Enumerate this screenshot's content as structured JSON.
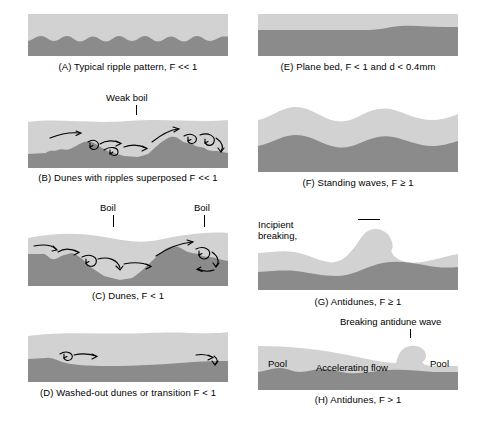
{
  "figure": {
    "colors": {
      "water": "#d2d2d2",
      "sediment": "#8b8b8b",
      "arrow": "#000000",
      "background": "#ffffff",
      "text": "#000000"
    }
  },
  "panels": [
    {
      "id": "A",
      "caption": "(A) Typical ripple pattern, F << 1",
      "annotations": []
    },
    {
      "id": "B",
      "caption": "(B) Dunes with ripples superposed F << 1",
      "annotations": [
        {
          "name": "weak-boil",
          "text": "Weak boil"
        }
      ]
    },
    {
      "id": "C",
      "caption": "(C) Dunes, F < 1",
      "annotations": [
        {
          "name": "boil-left",
          "text": "Boil"
        },
        {
          "name": "boil-right",
          "text": "Boil"
        }
      ]
    },
    {
      "id": "D",
      "caption": "(D) Washed-out dunes or transition F < 1",
      "annotations": []
    },
    {
      "id": "E",
      "caption": "(E) Plane bed, F < 1 and d < 0.4mm",
      "annotations": []
    },
    {
      "id": "F",
      "caption": "(F) Standing waves, F ≥ 1",
      "annotations": []
    },
    {
      "id": "G",
      "caption": "(G) Antidunes, F ≥ 1",
      "annotations": [
        {
          "name": "incipient-breaking",
          "line1": "Incipient breaking,",
          "line2": "and moving upstream"
        }
      ]
    },
    {
      "id": "H",
      "caption": "(H) Antidunes, F > 1",
      "annotations": [
        {
          "name": "breaking-antidune-wave",
          "text": "Breaking antidune wave"
        },
        {
          "name": "pool-left",
          "text": "Pool"
        },
        {
          "name": "accelerating-flow",
          "text": "Accelerating flow"
        },
        {
          "name": "pool-right",
          "text": "Pool"
        }
      ]
    }
  ]
}
